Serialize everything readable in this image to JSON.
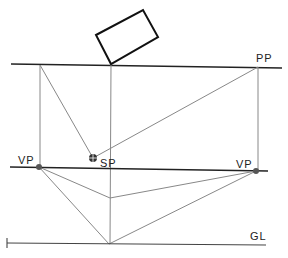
{
  "diagram": {
    "labels": {
      "picture_plane": "PP",
      "station_point": "SP",
      "vanishing_point_left": "VP",
      "vanishing_point_right": "VP",
      "ground_line": "GL"
    },
    "colors": {
      "line": "#222222",
      "projector": "#888888",
      "point": "#555555",
      "background": "#ffffff"
    }
  }
}
